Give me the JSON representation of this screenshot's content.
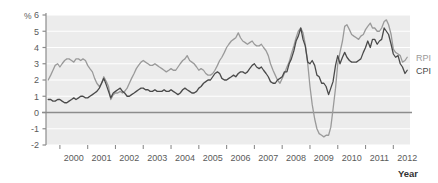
{
  "chart_data": {
    "type": "line",
    "title": "",
    "subtitle": "",
    "xlabel": "Year",
    "ylabel": "%",
    "xlim": [
      1999.5,
      2012.6
    ],
    "ylim": [
      -2,
      6
    ],
    "grid": true,
    "legend_position": "right-inline",
    "y_ticks": [
      6,
      5,
      4,
      3,
      2,
      1,
      0,
      -1,
      -2
    ],
    "y_tick_labels": [
      "6",
      "5",
      "4",
      "3",
      "2",
      "1",
      "0",
      "-1",
      "-2"
    ],
    "x_ticks": [
      2000,
      2001,
      2002,
      2003,
      2004,
      2005,
      2006,
      2007,
      2008,
      2009,
      2010,
      2011,
      2012
    ],
    "x_tick_labels": [
      "2000",
      "2001",
      "2002",
      "2003",
      "2004",
      "2005",
      "2006",
      "2007",
      "2008",
      "2009",
      "2010",
      "2011",
      "2012"
    ],
    "zero_line": 0,
    "colors": {
      "rpi": "#9a9a9a",
      "cpi": "#4a4a4a",
      "plot_background": "#ececec",
      "gridline": "#ffffff",
      "axis": "#8c8c8c",
      "zero_line": "#8c8c8c",
      "text": "#5a5a5a"
    },
    "series": [
      {
        "name": "RPI",
        "label": "RPI",
        "color": "#9a9a9a",
        "x": [
          1999.58,
          1999.67,
          1999.75,
          1999.83,
          1999.92,
          2000.0,
          2000.08,
          2000.17,
          2000.25,
          2000.33,
          2000.42,
          2000.5,
          2000.58,
          2000.67,
          2000.75,
          2000.83,
          2000.92,
          2001.0,
          2001.08,
          2001.17,
          2001.25,
          2001.33,
          2001.42,
          2001.5,
          2001.58,
          2001.67,
          2001.75,
          2001.83,
          2001.92,
          2002.0,
          2002.08,
          2002.17,
          2002.25,
          2002.33,
          2002.42,
          2002.5,
          2002.58,
          2002.67,
          2002.75,
          2002.83,
          2002.92,
          2003.0,
          2003.08,
          2003.17,
          2003.25,
          2003.33,
          2003.42,
          2003.5,
          2003.58,
          2003.67,
          2003.75,
          2003.83,
          2003.92,
          2004.0,
          2004.08,
          2004.17,
          2004.25,
          2004.33,
          2004.42,
          2004.5,
          2004.58,
          2004.67,
          2004.75,
          2004.83,
          2004.92,
          2005.0,
          2005.08,
          2005.17,
          2005.25,
          2005.33,
          2005.42,
          2005.5,
          2005.58,
          2005.67,
          2005.75,
          2005.83,
          2005.92,
          2006.0,
          2006.08,
          2006.17,
          2006.25,
          2006.33,
          2006.42,
          2006.5,
          2006.58,
          2006.67,
          2006.75,
          2006.83,
          2006.92,
          2007.0,
          2007.08,
          2007.17,
          2007.25,
          2007.33,
          2007.42,
          2007.5,
          2007.58,
          2007.67,
          2007.75,
          2007.83,
          2007.92,
          2008.0,
          2008.08,
          2008.17,
          2008.25,
          2008.33,
          2008.42,
          2008.5,
          2008.58,
          2008.67,
          2008.75,
          2008.83,
          2008.92,
          2009.0,
          2009.08,
          2009.17,
          2009.25,
          2009.33,
          2009.42,
          2009.5,
          2009.58,
          2009.67,
          2009.75,
          2009.83,
          2009.92,
          2010.0,
          2010.08,
          2010.17,
          2010.25,
          2010.33,
          2010.42,
          2010.5,
          2010.58,
          2010.67,
          2010.75,
          2010.83,
          2010.92,
          2011.0,
          2011.08,
          2011.17,
          2011.25,
          2011.33,
          2011.42,
          2011.5,
          2011.58,
          2011.67,
          2011.75,
          2011.83,
          2011.92,
          2012.0,
          2012.08,
          2012.17,
          2012.25,
          2012.33,
          2012.42,
          2012.5
        ],
        "values": [
          2.0,
          2.3,
          2.6,
          2.9,
          3.0,
          2.8,
          3.0,
          3.2,
          3.3,
          3.3,
          3.2,
          3.1,
          3.3,
          3.3,
          3.2,
          3.3,
          3.2,
          2.9,
          2.7,
          2.5,
          2.1,
          1.8,
          1.6,
          1.8,
          2.2,
          1.9,
          1.6,
          0.8,
          1.1,
          1.2,
          1.2,
          1.3,
          1.2,
          1.3,
          1.5,
          1.8,
          2.1,
          2.4,
          2.7,
          2.9,
          3.1,
          3.2,
          3.1,
          3.0,
          2.9,
          2.9,
          3.0,
          2.9,
          2.8,
          2.7,
          2.6,
          2.5,
          2.6,
          2.7,
          2.6,
          2.6,
          2.8,
          3.0,
          3.2,
          3.3,
          3.5,
          3.2,
          3.1,
          3.0,
          2.8,
          2.6,
          2.7,
          2.6,
          2.4,
          2.3,
          2.3,
          2.4,
          2.6,
          2.9,
          3.2,
          3.4,
          3.7,
          4.0,
          4.2,
          4.4,
          4.5,
          4.6,
          4.9,
          4.6,
          4.4,
          4.3,
          4.2,
          4.3,
          4.4,
          4.2,
          4.1,
          4.1,
          4.2,
          4.0,
          3.8,
          3.5,
          3.0,
          2.6,
          2.3,
          2.0,
          1.8,
          2.1,
          2.4,
          2.8,
          3.1,
          3.6,
          4.1,
          4.6,
          5.0,
          5.2,
          4.9,
          4.2,
          3.0,
          1.6,
          0.5,
          -0.4,
          -1.0,
          -1.3,
          -1.4,
          -1.5,
          -1.4,
          -1.4,
          -0.9,
          0.2,
          1.5,
          3.0,
          3.7,
          4.4,
          5.3,
          5.4,
          5.1,
          4.8,
          4.7,
          4.6,
          4.5,
          4.7,
          4.8,
          5.1,
          5.3,
          5.5,
          5.2,
          5.2,
          5.0,
          5.0,
          5.2,
          5.6,
          5.7,
          5.4,
          4.8,
          3.9,
          3.7,
          3.6,
          3.5,
          3.1,
          3.2,
          3.4
        ]
      },
      {
        "name": "CPI",
        "label": "CPI",
        "color": "#4a4a4a",
        "x": [
          1999.58,
          1999.67,
          1999.75,
          1999.83,
          1999.92,
          2000.0,
          2000.08,
          2000.17,
          2000.25,
          2000.33,
          2000.42,
          2000.5,
          2000.58,
          2000.67,
          2000.75,
          2000.83,
          2000.92,
          2001.0,
          2001.08,
          2001.17,
          2001.25,
          2001.33,
          2001.42,
          2001.5,
          2001.58,
          2001.67,
          2001.75,
          2001.83,
          2001.92,
          2002.0,
          2002.08,
          2002.17,
          2002.25,
          2002.33,
          2002.42,
          2002.5,
          2002.58,
          2002.67,
          2002.75,
          2002.83,
          2002.92,
          2003.0,
          2003.08,
          2003.17,
          2003.25,
          2003.33,
          2003.42,
          2003.5,
          2003.58,
          2003.67,
          2003.75,
          2003.83,
          2003.92,
          2004.0,
          2004.08,
          2004.17,
          2004.25,
          2004.33,
          2004.42,
          2004.5,
          2004.58,
          2004.67,
          2004.75,
          2004.83,
          2004.92,
          2005.0,
          2005.08,
          2005.17,
          2005.25,
          2005.33,
          2005.42,
          2005.5,
          2005.58,
          2005.67,
          2005.75,
          2005.83,
          2005.92,
          2006.0,
          2006.08,
          2006.17,
          2006.25,
          2006.33,
          2006.42,
          2006.5,
          2006.58,
          2006.67,
          2006.75,
          2006.83,
          2006.92,
          2007.0,
          2007.08,
          2007.17,
          2007.25,
          2007.33,
          2007.42,
          2007.5,
          2007.58,
          2007.67,
          2007.75,
          2007.83,
          2007.92,
          2008.0,
          2008.08,
          2008.17,
          2008.25,
          2008.33,
          2008.42,
          2008.5,
          2008.58,
          2008.67,
          2008.75,
          2008.83,
          2008.92,
          2009.0,
          2009.08,
          2009.17,
          2009.25,
          2009.33,
          2009.42,
          2009.5,
          2009.58,
          2009.67,
          2009.75,
          2009.83,
          2009.92,
          2010.0,
          2010.08,
          2010.17,
          2010.25,
          2010.33,
          2010.42,
          2010.5,
          2010.58,
          2010.67,
          2010.75,
          2010.83,
          2010.92,
          2011.0,
          2011.08,
          2011.17,
          2011.25,
          2011.33,
          2011.42,
          2011.5,
          2011.58,
          2011.67,
          2011.75,
          2011.83,
          2011.92,
          2012.0,
          2012.08,
          2012.17,
          2012.25,
          2012.33,
          2012.42,
          2012.5
        ],
        "values": [
          0.8,
          0.8,
          0.7,
          0.7,
          0.8,
          0.8,
          0.7,
          0.6,
          0.6,
          0.7,
          0.8,
          0.9,
          0.8,
          0.9,
          1.0,
          1.0,
          0.9,
          0.9,
          1.0,
          1.1,
          1.2,
          1.3,
          1.5,
          1.8,
          2.1,
          1.7,
          1.3,
          0.9,
          1.2,
          1.3,
          1.4,
          1.5,
          1.3,
          1.2,
          1.0,
          1.0,
          1.1,
          1.2,
          1.3,
          1.4,
          1.5,
          1.5,
          1.4,
          1.4,
          1.3,
          1.3,
          1.4,
          1.3,
          1.3,
          1.3,
          1.4,
          1.3,
          1.3,
          1.4,
          1.3,
          1.2,
          1.1,
          1.2,
          1.4,
          1.5,
          1.4,
          1.3,
          1.2,
          1.2,
          1.3,
          1.5,
          1.6,
          1.8,
          1.9,
          2.0,
          2.0,
          2.2,
          2.4,
          2.5,
          2.4,
          2.1,
          2.0,
          2.0,
          2.1,
          2.2,
          2.3,
          2.2,
          2.4,
          2.5,
          2.5,
          2.4,
          2.5,
          2.7,
          2.9,
          3.0,
          2.8,
          2.7,
          2.8,
          2.6,
          2.4,
          2.2,
          1.9,
          1.8,
          1.8,
          2.0,
          2.1,
          2.2,
          2.5,
          2.5,
          3.0,
          3.3,
          3.8,
          4.4,
          4.7,
          5.2,
          4.5,
          4.1,
          3.1,
          3.0,
          3.2,
          2.9,
          2.3,
          2.2,
          1.8,
          1.8,
          1.6,
          1.1,
          1.5,
          1.9,
          2.9,
          3.5,
          3.0,
          3.4,
          3.7,
          3.4,
          3.2,
          3.1,
          3.1,
          3.1,
          3.2,
          3.3,
          3.7,
          4.0,
          4.4,
          4.0,
          4.5,
          4.5,
          4.2,
          4.4,
          4.5,
          5.2,
          5.0,
          4.8,
          4.2,
          3.6,
          3.4,
          3.5,
          3.0,
          2.8,
          2.4,
          2.6
        ]
      }
    ],
    "annotations": [
      {
        "text": "RPI",
        "series": "RPI",
        "position": "end-right"
      },
      {
        "text": "CPI",
        "series": "CPI",
        "position": "end-right"
      }
    ]
  }
}
